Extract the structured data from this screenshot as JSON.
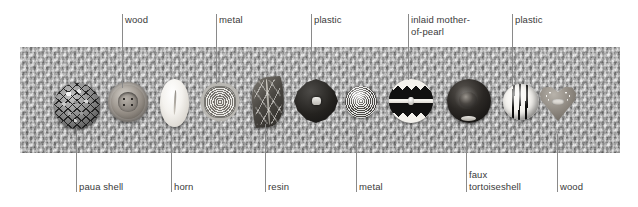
{
  "figure": {
    "kind": "annotated-photograph",
    "background_color": "#ffffff",
    "leader_line_color": "#8a8a8a",
    "label_color": "#3a3a3a",
    "strip": {
      "name": "knitted-fabric-strip",
      "base_color": "#b9b9b9"
    }
  },
  "labels_top": [
    {
      "id": "wood-top",
      "text": "wood",
      "line_x": 122,
      "text_x": 125,
      "text_y": 14,
      "line_top": 14,
      "line_bottom": 88
    },
    {
      "id": "metal-top",
      "text": "metal",
      "line_x": 216,
      "text_x": 219,
      "text_y": 14,
      "line_top": 14,
      "line_bottom": 84
    },
    {
      "id": "plastic-1",
      "text": "plastic",
      "line_x": 311,
      "text_x": 314,
      "text_y": 14,
      "line_top": 14,
      "line_bottom": 80
    },
    {
      "id": "inlaid-mop",
      "text": "inlaid mother-\nof-pearl",
      "line_x": 408,
      "text_x": 411,
      "text_y": 14,
      "line_top": 14,
      "line_bottom": 80
    },
    {
      "id": "plastic-2",
      "text": "plastic",
      "line_x": 512,
      "text_x": 515,
      "text_y": 14,
      "line_top": 14,
      "line_bottom": 86
    }
  ],
  "labels_bottom": [
    {
      "id": "paua-shell",
      "text": "paua shell",
      "line_x": 76,
      "text_x": 79,
      "text_y": 181,
      "line_top": 128,
      "line_bottom": 192
    },
    {
      "id": "horn",
      "text": "horn",
      "line_x": 171,
      "text_x": 174,
      "text_y": 181,
      "line_top": 128,
      "line_bottom": 192
    },
    {
      "id": "resin",
      "text": "resin",
      "line_x": 265,
      "text_x": 268,
      "text_y": 181,
      "line_top": 124,
      "line_bottom": 192
    },
    {
      "id": "metal-bot",
      "text": "metal",
      "line_x": 356,
      "text_x": 359,
      "text_y": 181,
      "line_top": 126,
      "line_bottom": 192
    },
    {
      "id": "faux-tort",
      "text": "faux\ntortoiseshell",
      "line_x": 466,
      "text_x": 469,
      "text_y": 169,
      "line_top": 130,
      "line_bottom": 192
    },
    {
      "id": "wood-bot",
      "text": "wood",
      "line_x": 557,
      "text_x": 560,
      "text_y": 181,
      "line_top": 134,
      "line_bottom": 192
    }
  ],
  "buttons": [
    {
      "id": "button-paua-shell",
      "material": "paua shell",
      "shape": "round mosaic disc"
    },
    {
      "id": "button-wood-round",
      "material": "wood",
      "shape": "round four-hole"
    },
    {
      "id": "button-horn",
      "material": "horn",
      "shape": "white oval"
    },
    {
      "id": "button-metal-spiral",
      "material": "metal",
      "shape": "spiral scalloped disc"
    },
    {
      "id": "button-resin-leaf",
      "material": "resin",
      "shape": "leaf"
    },
    {
      "id": "button-metal-quatrefoil",
      "material": "metal",
      "shape": "dark quatrefoil"
    },
    {
      "id": "button-plastic-dotted",
      "material": "plastic",
      "shape": "small dotted dome"
    },
    {
      "id": "button-inlaid-mop",
      "material": "inlaid mother-of-pearl",
      "shape": "zigzag disc"
    },
    {
      "id": "button-faux-tortoiseshell",
      "material": "faux tortoiseshell",
      "shape": "dark glossy dome"
    },
    {
      "id": "button-plastic-striped",
      "material": "plastic",
      "shape": "striped ball"
    },
    {
      "id": "button-wood-heart",
      "material": "wood",
      "shape": "heart"
    }
  ]
}
